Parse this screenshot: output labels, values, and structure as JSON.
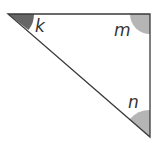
{
  "diagram": {
    "type": "right-triangle",
    "vertices": {
      "top_left": {
        "x": 8,
        "y": 14
      },
      "top_right": {
        "x": 150,
        "y": 14
      },
      "bottom_right": {
        "x": 150,
        "y": 137
      }
    },
    "angles": [
      {
        "id": "k",
        "label": "k",
        "vertex": "top_left",
        "fill": "#666666"
      },
      {
        "id": "m",
        "label": "m",
        "vertex": "top_right",
        "fill": "#b5b5b5",
        "right_angle": true
      },
      {
        "id": "n",
        "label": "n",
        "vertex": "bottom_right",
        "fill": "#b5b5b5"
      }
    ],
    "colors": {
      "stroke": "#3a3a3a",
      "background": "#ffffff"
    }
  }
}
